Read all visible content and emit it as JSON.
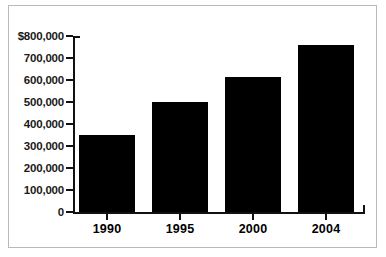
{
  "chart_data": {
    "type": "bar",
    "title": "",
    "subtitle": "",
    "xlabel": "",
    "ylabel": "",
    "categories": [
      "1990",
      "1995",
      "2000",
      "2004"
    ],
    "values": [
      350000,
      500000,
      615000,
      760000
    ],
    "series": [
      {
        "name": "",
        "values": [
          350000,
          500000,
          615000,
          760000
        ]
      }
    ],
    "ylim": [
      0,
      800000
    ],
    "ytick_values": [
      800000,
      700000,
      600000,
      500000,
      400000,
      300000,
      200000,
      100000,
      0
    ],
    "ytick_labels": [
      "$800,000",
      "700,000",
      "600,000",
      "500,000",
      "400,000",
      "300,000",
      "200,000",
      "100,000",
      "0"
    ],
    "xtick_labels": [
      "1990",
      "1995",
      "2000",
      "2004"
    ],
    "grid": false,
    "legend": false,
    "legend_position": "none",
    "bar_color": "#000000",
    "axis_color": "#111111",
    "background_color": "#ffffff",
    "border_color": "#b9b9b9",
    "annotations": []
  }
}
